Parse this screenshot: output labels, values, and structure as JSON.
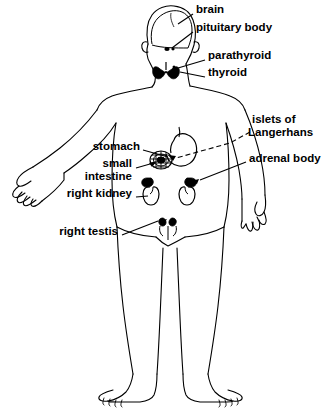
{
  "figure": {
    "background_color": "#ffffff",
    "ink_color": "#000000"
  },
  "labels": [
    {
      "id": "brain",
      "text": "brain",
      "x": 196,
      "y": 9,
      "align": "left"
    },
    {
      "id": "pituitary_body",
      "text": "pituitary body",
      "x": 196,
      "y": 27,
      "align": "left"
    },
    {
      "id": "parathyroid",
      "text": "parathyroid",
      "x": 208,
      "y": 55,
      "align": "left"
    },
    {
      "id": "thyroid",
      "text": "thyroid",
      "x": 208,
      "y": 72,
      "align": "left"
    },
    {
      "id": "islets_line1",
      "text": "islets of",
      "x": 252,
      "y": 119,
      "align": "left"
    },
    {
      "id": "islets_line2",
      "text": "Langerhans",
      "x": 252,
      "y": 132,
      "align": "left"
    },
    {
      "id": "adrenal_body",
      "text": "adrenal body",
      "x": 249,
      "y": 158,
      "align": "left"
    },
    {
      "id": "stomach",
      "text": "stomach",
      "x": 140,
      "y": 146,
      "align": "right"
    },
    {
      "id": "small",
      "text": "small",
      "x": 132,
      "y": 163,
      "align": "right"
    },
    {
      "id": "intestine",
      "text": "intestine",
      "x": 132,
      "y": 176,
      "align": "right"
    },
    {
      "id": "right_kidney",
      "text": "right kidney",
      "x": 132,
      "y": 193,
      "align": "right"
    },
    {
      "id": "right_testis",
      "text": "right testis",
      "x": 118,
      "y": 231,
      "align": "right"
    }
  ],
  "organs": [
    {
      "id": "brain",
      "name": "brain",
      "fill": "none",
      "note": "dome outline inside skull"
    },
    {
      "id": "pituitary",
      "name": "pituitary-body",
      "fill": "black",
      "note": "tiny dot at base of brain"
    },
    {
      "id": "thyroid",
      "name": "thyroid-gland",
      "fill": "black",
      "note": "butterfly shape at throat"
    },
    {
      "id": "parathyroid",
      "name": "parathyroid-gland",
      "fill": "black",
      "note": "small lobes on thyroid"
    },
    {
      "id": "stomach",
      "name": "stomach",
      "fill": "none",
      "note": "J-shaped curve upper abdomen"
    },
    {
      "id": "pancreas",
      "name": "pancreas-islets",
      "fill": "black",
      "note": "coiled hatched mass"
    },
    {
      "id": "kidney_right",
      "name": "right-kidney",
      "fill": "none",
      "note": "bean outline viewer-left"
    },
    {
      "id": "kidney_left",
      "name": "left-kidney",
      "fill": "none",
      "note": "bean outline viewer-right"
    },
    {
      "id": "adrenal_right",
      "name": "right-adrenal-body",
      "fill": "black",
      "note": "cap atop right kidney"
    },
    {
      "id": "adrenal_left",
      "name": "left-adrenal-body",
      "fill": "black",
      "note": "cap atop left kidney"
    },
    {
      "id": "testes",
      "name": "testes",
      "fill": "black",
      "note": "paired marks at groin"
    }
  ]
}
